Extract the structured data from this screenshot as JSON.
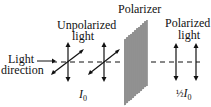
{
  "labels": {
    "light_direction_line1": "Light",
    "light_direction_line2": "direction",
    "unpolarized_line1": "Unpolarized",
    "unpolarized_line2": "light",
    "polarizer": "Polarizer",
    "polarized_line1": "Polarized",
    "polarized_line2": "light",
    "intensity_in": "I",
    "intensity_in_sub": "0",
    "intensity_out_frac": "½",
    "intensity_out": "I",
    "intensity_out_sub": "0"
  },
  "colors": {
    "line": "#111111",
    "polarizer_stripe": "#555555",
    "polarizer_fill": "#dddddd"
  }
}
